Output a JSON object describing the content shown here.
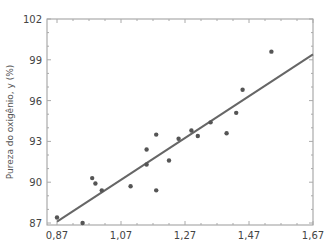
{
  "chart_data": {
    "type": "scatter",
    "title": "",
    "xlabel": "",
    "ylabel": "Pureza do oxigênio, y (%)",
    "xlim": [
      0.85,
      1.67
    ],
    "ylim": [
      87,
      102
    ],
    "x_ticks": [
      "0,87",
      "1,07",
      "1,27",
      "1,47",
      "1,67"
    ],
    "x_tick_values": [
      0.87,
      1.07,
      1.27,
      1.47,
      1.67
    ],
    "y_ticks": [
      "87",
      "90",
      "93",
      "96",
      "99",
      "102"
    ],
    "y_tick_values": [
      87,
      90,
      93,
      96,
      99,
      102
    ],
    "grid": false,
    "legend": null,
    "series": [
      {
        "name": "observações",
        "type": "scatter",
        "color": "#555555",
        "points": [
          [
            0.87,
            87.4
          ],
          [
            0.95,
            87.0
          ],
          [
            0.98,
            90.3
          ],
          [
            0.99,
            89.9
          ],
          [
            1.01,
            89.4
          ],
          [
            1.1,
            89.7
          ],
          [
            1.15,
            91.3
          ],
          [
            1.15,
            92.4
          ],
          [
            1.18,
            89.4
          ],
          [
            1.18,
            93.5
          ],
          [
            1.22,
            91.6
          ],
          [
            1.25,
            93.2
          ],
          [
            1.29,
            93.8
          ],
          [
            1.31,
            93.4
          ],
          [
            1.35,
            94.4
          ],
          [
            1.4,
            93.6
          ],
          [
            1.43,
            95.1
          ],
          [
            1.45,
            96.8
          ],
          [
            1.54,
            99.6
          ]
        ]
      },
      {
        "name": "reta ajustada",
        "type": "line",
        "color": "#666666",
        "points": [
          [
            0.87,
            87.1
          ],
          [
            1.67,
            99.4
          ]
        ]
      }
    ]
  }
}
